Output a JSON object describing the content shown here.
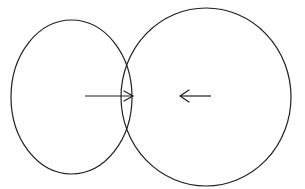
{
  "canvas": {
    "width": 305,
    "height": 189,
    "background_color": "#ffffff",
    "stroke_color": "#1f1f1f"
  },
  "diagram": {
    "title": "",
    "stroke_color": "#1f1f1f",
    "stroke_width": 1.2,
    "shapes": [
      {
        "name": "left-circle",
        "type": "ellipse",
        "cx": 71.5,
        "cy": 97,
        "rx": 60.5,
        "ry": 77,
        "stroke_color": "#1f1f1f",
        "stroke_width": 1.2,
        "fill": "none"
      },
      {
        "name": "right-circle",
        "type": "ellipse",
        "cx": 206,
        "cy": 97,
        "rx": 85,
        "ry": 89,
        "stroke_color": "#1f1f1f",
        "stroke_width": 1.2,
        "fill": "none"
      }
    ],
    "arrows": [
      {
        "name": "right-pointing-arrow",
        "direction": "right",
        "tail_x": 85,
        "tip_x": 133,
        "y": 96,
        "head_length": 9,
        "head_halfwidth": 5,
        "stroke_color": "#1f1f1f",
        "stroke_width": 1.2
      },
      {
        "name": "left-pointing-arrow",
        "direction": "left",
        "tail_x": 211,
        "tip_x": 180,
        "y": 96,
        "head_length": 9,
        "head_halfwidth": 6,
        "stroke_color": "#1f1f1f",
        "stroke_width": 1.2
      }
    ],
    "intersection": {
      "name": "lens-overlap-region",
      "upper_crossing": {
        "x": 130,
        "y": 46
      },
      "lower_crossing": {
        "x": 130,
        "y": 148
      }
    }
  }
}
